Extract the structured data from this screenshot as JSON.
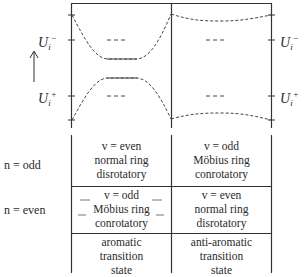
{
  "diagram": {
    "title": "",
    "energy_levels": {
      "upper": {
        "symbol": "U",
        "subscript": "i",
        "superscript": "−"
      },
      "lower": {
        "symbol": "U",
        "subscript": "i",
        "superscript": "+"
      }
    },
    "axis": {
      "arrow": "up-arrow",
      "meaning": "energy"
    },
    "columns": [
      {
        "id": "left",
        "curve_shape": "levels converge toward middle (avoided crossing)"
      },
      {
        "id": "right",
        "curve_shape": "levels diverge toward middle"
      }
    ],
    "rows": [
      {
        "label": "n = odd",
        "cells": [
          {
            "lines": [
              "v = even",
              "normal ring",
              "disrotatory"
            ]
          },
          {
            "lines": [
              "v = odd",
              "Möbius ring",
              "conrotatory"
            ]
          }
        ]
      },
      {
        "label": "n = even",
        "cells": [
          {
            "lines": [
              "v = odd",
              "Möbius ring",
              "conrotatory"
            ]
          },
          {
            "lines": [
              "v = even",
              "normal ring",
              "disrotatory"
            ]
          }
        ]
      },
      {
        "label": "",
        "cells": [
          {
            "lines": [
              "aromatic",
              "transition",
              "state"
            ]
          },
          {
            "lines": [
              "anti-aromatic",
              "transition",
              "state"
            ]
          }
        ]
      }
    ],
    "colors": {
      "line": "#333333",
      "text": "#2a2a2a",
      "background": "#ffffff"
    }
  }
}
